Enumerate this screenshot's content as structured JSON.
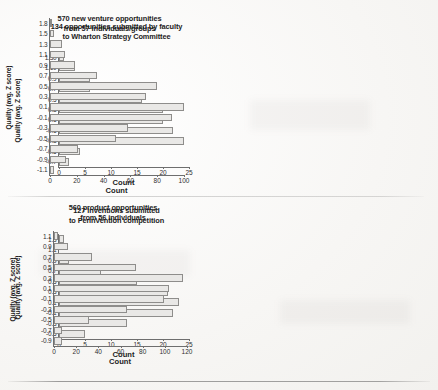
{
  "figure": {
    "background_color": "#f7f6f4",
    "bar_fill_color": "#e9e8e6",
    "bar_border_color": "#8e8d8b",
    "axis_color": "#6e6e6e"
  },
  "chart_data": [
    {
      "id": "wharton-strategy-committee",
      "type": "bar",
      "orientation": "horizontal",
      "title": "134 opportunities submitted by faculty to Wharton Strategy Committee",
      "title_lines": [
        "134 opportunities submitted by faculty",
        "to Wharton Strategy Committee"
      ],
      "xlabel": "Count",
      "ylabel": "Quality (avg. Z score)",
      "categories": [
        "1.30",
        "1.10",
        "0.9",
        "0.7",
        "0.5",
        "0.3",
        "0.1",
        "-0.1",
        "-0.3",
        "-0.5",
        "-0.7"
      ],
      "values": [
        1,
        3,
        6,
        6,
        16,
        20,
        20,
        22,
        24,
        4,
        2
      ],
      "xlim": [
        0,
        25
      ],
      "xticks": [
        0,
        5,
        10,
        15,
        20,
        25
      ],
      "grid": false,
      "legend": false
    },
    {
      "id": "new-venture-opportunities",
      "type": "bar",
      "orientation": "horizontal",
      "title": "570 new venture opportunities from 57 individuals/groups",
      "title_lines": [
        "570 new venture opportunities",
        "from 57 individuals/groups"
      ],
      "xlabel": "Count",
      "ylabel": "Quality (avg. Z score)",
      "categories": [
        "1.8",
        "1.5",
        "1.3",
        "1.1",
        "0.9",
        "0.7",
        "0.5",
        "0.3",
        "0.1",
        "-0.1",
        "-0.3",
        "-0.5",
        "-0.7",
        "-0.9",
        "-1.1"
      ],
      "values": [
        1,
        3,
        9,
        11,
        19,
        35,
        80,
        72,
        100,
        91,
        58,
        49,
        21,
        12,
        3
      ],
      "xlim": [
        0,
        100
      ],
      "xticks": [
        0,
        20,
        40,
        60,
        80,
        100
      ],
      "grid": false,
      "legend": false
    },
    {
      "id": "pennvention-inventions",
      "type": "bar",
      "orientation": "horizontal",
      "title": "127 inventions submitted to PennVention competition",
      "title_lines": [
        "127 inventions submitted",
        "to PennVention competition"
      ],
      "xlabel": "Count",
      "ylabel": "Quality (avg. Z score)",
      "categories": [
        "1.3",
        "1.1",
        "0.9",
        "0.7",
        "0.5",
        "0.3",
        "0.1",
        "-0.1",
        "-0.3",
        "-0.5"
      ],
      "values": [
        1,
        0,
        2,
        8,
        15,
        21,
        23,
        22,
        13,
        5
      ],
      "xlim": [
        0,
        25
      ],
      "xticks": [
        0,
        5,
        10,
        15,
        20,
        25
      ],
      "grid": false,
      "legend": false
    },
    {
      "id": "product-opportunities",
      "type": "bar",
      "orientation": "horizontal",
      "title": "560 product opportunities from 56 individuals",
      "title_lines": [
        "560 product opportunities",
        "from 56 individuals"
      ],
      "xlabel": "Count",
      "ylabel": "Quality (avg. Z score)",
      "categories": [
        "1.1",
        "0.9",
        "0.7",
        "0.5",
        "0.3",
        "0.1",
        "-0.1",
        "-0.3",
        "-0.5",
        "-0.7",
        "-0.9"
      ],
      "values": [
        4,
        13,
        34,
        74,
        116,
        104,
        99,
        66,
        32,
        7,
        7
      ],
      "xlim": [
        0,
        120
      ],
      "xticks": [
        0,
        20,
        40,
        60,
        80,
        100,
        120
      ],
      "grid": false,
      "legend": false
    }
  ]
}
